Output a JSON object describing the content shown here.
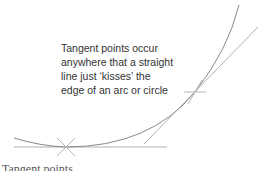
{
  "diagram": {
    "caption_lines": [
      "Tangent points occur",
      "anywhere that a straight",
      "line just ‘kisses’ the",
      "edge of an arc or circle"
    ],
    "footer_label": "Tangent points",
    "colors": {
      "arc": "#8a8a8a",
      "lines": "#a8a8a8",
      "marks": "#b0b0b0",
      "text": "#333333"
    },
    "tangent_points": [
      {
        "name": "bottom",
        "x": 66,
        "y": 147
      },
      {
        "name": "upper-right",
        "x": 195,
        "y": 92
      }
    ]
  }
}
